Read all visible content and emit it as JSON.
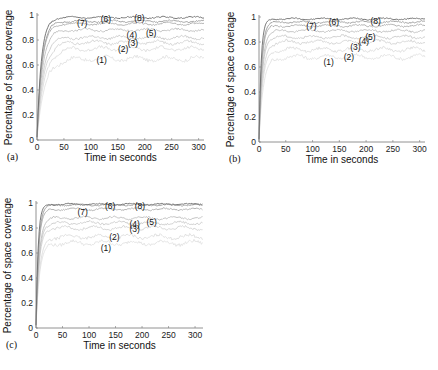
{
  "chart_data": [
    {
      "panel": "(a)",
      "type": "line",
      "xlabel": "Time in seconds",
      "ylabel": "Percentage of space coverage",
      "xlim": [
        0,
        310
      ],
      "ylim": [
        0,
        1
      ],
      "xticks": [
        0,
        50,
        100,
        150,
        200,
        250,
        300
      ],
      "yticks": [
        0,
        0.2,
        0.4,
        0.6,
        0.8,
        1
      ],
      "grid": false,
      "box": {
        "x0": 37,
        "x1": 204,
        "y0": 140,
        "y1": 15
      },
      "series": [
        {
          "name": "(1)",
          "plateau": 0.65,
          "rise": 14,
          "gray": "#e2e2e2",
          "label_at": [
            120,
            0.64
          ]
        },
        {
          "name": "(2)",
          "plateau": 0.73,
          "rise": 13,
          "gray": "#dcdcdc",
          "label_at": [
            160,
            0.73
          ]
        },
        {
          "name": "(3)",
          "plateau": 0.78,
          "rise": 12,
          "gray": "#d4d4d4",
          "label_at": [
            178,
            0.78
          ]
        },
        {
          "name": "(4)",
          "plateau": 0.82,
          "rise": 11,
          "gray": "#cbcbcb",
          "label_at": [
            176,
            0.84
          ]
        },
        {
          "name": "(5)",
          "plateau": 0.88,
          "rise": 10,
          "gray": "#bdbdbd",
          "label_at": [
            212,
            0.86
          ]
        },
        {
          "name": "(6)",
          "plateau": 0.95,
          "rise": 9,
          "gray": "#9a9a9a",
          "label_at": [
            128,
            0.97
          ]
        },
        {
          "name": "(7)",
          "plateau": 0.93,
          "rise": 9,
          "gray": "#aaaaaa",
          "label_at": [
            84,
            0.94
          ]
        },
        {
          "name": "(8)",
          "plateau": 0.98,
          "rise": 8,
          "gray": "#6a6a6a",
          "label_at": [
            190,
            0.98
          ]
        }
      ]
    },
    {
      "panel": "(b)",
      "type": "line",
      "xlabel": "Time in seconds",
      "ylabel": "Percentage of space coverage",
      "xlim": [
        0,
        310
      ],
      "ylim": [
        0,
        1
      ],
      "xticks": [
        0,
        50,
        100,
        150,
        200,
        250,
        300
      ],
      "yticks": [
        0,
        0.2,
        0.4,
        0.6,
        0.8,
        1
      ],
      "grid": false,
      "box": {
        "x0": 259,
        "x1": 425,
        "y0": 142,
        "y1": 17
      },
      "series": [
        {
          "name": "(1)",
          "plateau": 0.68,
          "rise": 8,
          "gray": "#e2e2e2",
          "label_at": [
            130,
            0.64
          ]
        },
        {
          "name": "(2)",
          "plateau": 0.74,
          "rise": 7,
          "gray": "#dcdcdc",
          "label_at": [
            168,
            0.68
          ]
        },
        {
          "name": "(3)",
          "plateau": 0.8,
          "rise": 7,
          "gray": "#d4d4d4",
          "label_at": [
            180,
            0.76
          ]
        },
        {
          "name": "(4)",
          "plateau": 0.84,
          "rise": 6,
          "gray": "#cbcbcb",
          "label_at": [
            196,
            0.81
          ]
        },
        {
          "name": "(5)",
          "plateau": 0.89,
          "rise": 6,
          "gray": "#bdbdbd",
          "label_at": [
            208,
            0.84
          ]
        },
        {
          "name": "(6)",
          "plateau": 0.96,
          "rise": 5,
          "gray": "#9a9a9a",
          "label_at": [
            140,
            0.96
          ]
        },
        {
          "name": "(7)",
          "plateau": 0.93,
          "rise": 5,
          "gray": "#aaaaaa",
          "label_at": [
            98,
            0.93
          ]
        },
        {
          "name": "(8)",
          "plateau": 0.985,
          "rise": 4,
          "gray": "#6a6a6a",
          "label_at": [
            218,
            0.97
          ]
        }
      ]
    },
    {
      "panel": "(c)",
      "type": "line",
      "xlabel": "Time in seconds",
      "ylabel": "Percentage of space coverage",
      "xlim": [
        0,
        315
      ],
      "ylim": [
        0,
        1
      ],
      "xticks": [
        0,
        50,
        100,
        150,
        200,
        250,
        300
      ],
      "yticks": [
        0,
        0.2,
        0.4,
        0.6,
        0.8,
        1
      ],
      "grid": false,
      "box": {
        "x0": 36,
        "x1": 203,
        "y0": 328,
        "y1": 203
      },
      "series": [
        {
          "name": "(1)",
          "plateau": 0.68,
          "rise": 7,
          "gray": "#e2e2e2",
          "label_at": [
            132,
            0.64
          ]
        },
        {
          "name": "(2)",
          "plateau": 0.73,
          "rise": 7,
          "gray": "#dcdcdc",
          "label_at": [
            148,
            0.73
          ]
        },
        {
          "name": "(3)",
          "plateau": 0.8,
          "rise": 6,
          "gray": "#d4d4d4",
          "label_at": [
            186,
            0.79
          ]
        },
        {
          "name": "(4)",
          "plateau": 0.84,
          "rise": 6,
          "gray": "#cbcbcb",
          "label_at": [
            186,
            0.83
          ]
        },
        {
          "name": "(5)",
          "plateau": 0.88,
          "rise": 6,
          "gray": "#bdbdbd",
          "label_at": [
            218,
            0.85
          ]
        },
        {
          "name": "(6)",
          "plateau": 0.985,
          "rise": 5,
          "gray": "#9a9a9a",
          "label_at": [
            140,
            0.98
          ]
        },
        {
          "name": "(7)",
          "plateau": 0.95,
          "rise": 5,
          "gray": "#aaaaaa",
          "label_at": [
            88,
            0.93
          ]
        },
        {
          "name": "(8)",
          "plateau": 0.99,
          "rise": 4,
          "gray": "#6a6a6a",
          "label_at": [
            196,
            0.98
          ]
        }
      ]
    }
  ]
}
